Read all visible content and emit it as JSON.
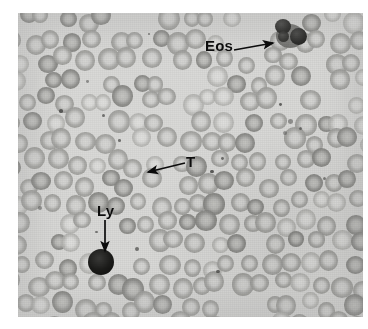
{
  "figure": {
    "kind": "blood-smear-micrograph",
    "modality": "light microscopy, Wright-Giemsa stained peripheral blood smear",
    "rendering": "grayscale halftone print",
    "background_color": "#ffffff",
    "field_color": "#d9d9d7",
    "cell_color": "#a6a6a3",
    "annotation_color": "#0c0c0c",
    "plate": {
      "left": 18,
      "top": 13,
      "width": 345,
      "height": 304
    }
  },
  "annotations": [
    {
      "id": "eos",
      "label": "Eos",
      "meaning": "eosinophil",
      "label_x": 205,
      "label_y": 38,
      "arrow": {
        "x1": 234,
        "y1": 50,
        "x2": 273,
        "y2": 43,
        "head": "end"
      },
      "target": {
        "x": 273,
        "y": 22
      }
    },
    {
      "id": "t",
      "label": "T",
      "meaning": "thrombocyte",
      "label_x": 186,
      "label_y": 154,
      "arrow": {
        "x1": 185,
        "y1": 163,
        "x2": 148,
        "y2": 172,
        "head": "end"
      },
      "target": {
        "x": 144,
        "y": 172
      }
    },
    {
      "id": "ly",
      "label": "Ly",
      "meaning": "lymphocyte",
      "label_x": 97,
      "label_y": 203,
      "arrow": {
        "x1": 105,
        "y1": 220,
        "x2": 105,
        "y2": 251,
        "head": "end"
      },
      "target": {
        "x": 83,
        "y": 249
      }
    }
  ],
  "cells": {
    "rbc_note": "erythrocytes with central pallor filling the field",
    "leukocytes": [
      {
        "type": "eosinophil",
        "x": 256,
        "y": 6,
        "w": 34,
        "h": 30,
        "tone": "very-dark-bilobed"
      },
      {
        "type": "lymphocyte",
        "x": 70,
        "y": 236,
        "w": 26,
        "h": 26,
        "tone": "very-dark-round"
      }
    ]
  }
}
